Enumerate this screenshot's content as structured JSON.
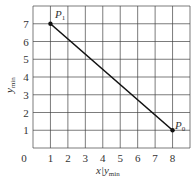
{
  "chart_data": {
    "type": "line",
    "title": "",
    "xlabel": "x|y_min",
    "ylabel": "y_min",
    "xlim": [
      0,
      9
    ],
    "ylim": [
      0,
      8
    ],
    "x_ticks": [
      "0",
      "1",
      "2",
      "3",
      "4",
      "5",
      "6",
      "7",
      "8"
    ],
    "y_ticks": [
      "1",
      "2",
      "3",
      "4",
      "5",
      "6",
      "7"
    ],
    "grid": true,
    "series": [
      {
        "name": "P1-P0 segment",
        "points": [
          {
            "label": "P1",
            "x": 1,
            "y": 7
          },
          {
            "label": "P0",
            "x": 8,
            "y": 1
          }
        ]
      }
    ],
    "annotations": [
      {
        "text": "P1",
        "x": 1,
        "y": 7
      },
      {
        "text": "P0",
        "x": 8,
        "y": 1
      }
    ]
  },
  "labels": {
    "x_main": "x|y",
    "x_sub": "min",
    "y_main": "y",
    "y_sub": "min",
    "p1_main": "P",
    "p1_sub": "1",
    "p0_main": "P",
    "p0_sub": "0"
  },
  "colors": {
    "grid": "#444444",
    "line": "#111111",
    "text": "#333333"
  }
}
